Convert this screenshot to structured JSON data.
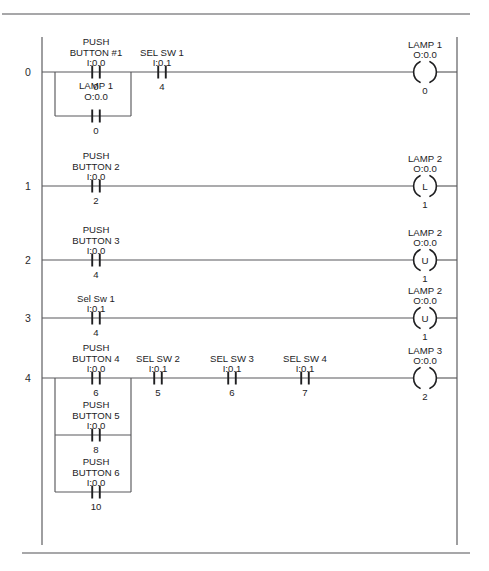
{
  "diagram": {
    "rail": {
      "left_x": 42,
      "right_x": 457,
      "top_y": 55,
      "bottom_y": 545
    },
    "separators": [
      {
        "name": "top-separator",
        "y": 14,
        "x1": 2,
        "x2": 470
      },
      {
        "name": "bottom-separator",
        "y": 553,
        "x1": 22,
        "x2": 470
      }
    ]
  },
  "rungs": [
    {
      "number": "0",
      "y": 72,
      "elements": [
        {
          "kind": "contact",
          "name": "push-button-1-contact",
          "x": 96,
          "line1": "PUSH",
          "line2": "BUTTON #1",
          "address": "I:0.0",
          "bit": "0"
        },
        {
          "kind": "contact",
          "name": "sel-sw-1-contact",
          "x": 162,
          "line1": "",
          "line2": "SEL SW 1",
          "address": "I:0.1",
          "bit": "4"
        }
      ],
      "branch": {
        "name": "rung-0-branch",
        "x_start": 55,
        "x_end": 131,
        "y_offset": 44,
        "contact": {
          "name": "lamp-1-seal-in-contact",
          "x": 96,
          "line1": "LAMP 1",
          "line2": "O:0.0",
          "address": "",
          "bit": "0"
        }
      },
      "output": {
        "kind": "coil",
        "name": "lamp-1-coil",
        "x": 425,
        "line1": "LAMP 1",
        "line2": "O:0.0",
        "symbol": "",
        "bit": "0"
      }
    },
    {
      "number": "1",
      "y": 186,
      "elements": [
        {
          "kind": "contact",
          "name": "push-button-2-contact",
          "x": 96,
          "line1": "PUSH",
          "line2": "BUTTON 2",
          "address": "I:0.0",
          "bit": "2"
        }
      ],
      "branch": null,
      "output": {
        "kind": "coil",
        "name": "lamp-2-latch-coil",
        "x": 425,
        "line1": "LAMP 2",
        "line2": "O:0.0",
        "symbol": "L",
        "bit": "1"
      }
    },
    {
      "number": "2",
      "y": 260,
      "elements": [
        {
          "kind": "contact",
          "name": "push-button-3-contact",
          "x": 96,
          "line1": "PUSH",
          "line2": "BUTTON 3",
          "address": "I:0.0",
          "bit": "4"
        }
      ],
      "branch": null,
      "output": {
        "kind": "coil",
        "name": "lamp-2-unlatch-coil",
        "x": 425,
        "line1": "LAMP 2",
        "line2": "O:0.0",
        "symbol": "U",
        "bit": "1"
      }
    },
    {
      "number": "3",
      "y": 318,
      "elements": [
        {
          "kind": "contact",
          "name": "sel-sw-1-lowercase-contact",
          "x": 96,
          "line1": "",
          "line2": "Sel Sw 1",
          "address": "I:0.1",
          "bit": "4"
        }
      ],
      "branch": null,
      "output": {
        "kind": "coil",
        "name": "lamp-2-unlatch-coil-2",
        "x": 425,
        "line1": "LAMP 2",
        "line2": "O:0.0",
        "symbol": "U",
        "bit": "1"
      }
    },
    {
      "number": "4",
      "y": 378,
      "elements": [
        {
          "kind": "contact",
          "name": "push-button-4-contact",
          "x": 96,
          "line1": "PUSH",
          "line2": "BUTTON 4",
          "address": "I:0.0",
          "bit": "6"
        },
        {
          "kind": "contact",
          "name": "sel-sw-2-contact",
          "x": 158,
          "line1": "",
          "line2": "SEL SW 2",
          "address": "I:0.1",
          "bit": "5"
        },
        {
          "kind": "contact",
          "name": "sel-sw-3-contact",
          "x": 232,
          "line1": "",
          "line2": "SEL SW 3",
          "address": "I:0.1",
          "bit": "6"
        },
        {
          "kind": "contact",
          "name": "sel-sw-4-contact",
          "x": 305,
          "line1": "",
          "line2": "SEL SW 4",
          "address": "I:0.1",
          "bit": "7"
        }
      ],
      "multibranch": {
        "name": "rung-4-branch",
        "x_start": 55,
        "x_end": 131,
        "rows": [
          {
            "name": "push-button-5-contact",
            "y_offset": 57,
            "x": 96,
            "line1": "PUSH",
            "line2": "BUTTON 5",
            "address": "I:0.0",
            "bit": "8"
          },
          {
            "name": "push-button-6-contact",
            "y_offset": 114,
            "x": 96,
            "line1": "PUSH",
            "line2": "BUTTON 6",
            "address": "I:0.0",
            "bit": "10"
          }
        ]
      },
      "output": {
        "kind": "coil",
        "name": "lamp-3-coil",
        "x": 425,
        "line1": "LAMP 3",
        "line2": "O:0.0",
        "symbol": "",
        "bit": "2"
      }
    }
  ],
  "colors": {
    "wire": "#59595c",
    "rail": "#6a6a6d",
    "contact": "#1f1f21",
    "text": "#1d1d1f",
    "background": "#ffffff"
  }
}
